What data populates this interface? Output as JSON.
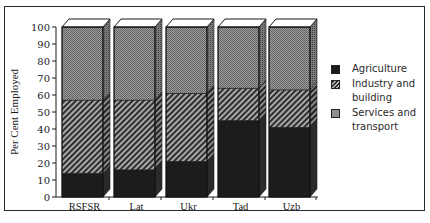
{
  "chart_data": {
    "type": "bar",
    "stacked": true,
    "style": "3d",
    "title": "",
    "xlabel": "",
    "ylabel": "Per Cent Employed",
    "ylim": [
      0,
      100
    ],
    "yticks": [
      0,
      10,
      20,
      30,
      40,
      50,
      60,
      70,
      80,
      90,
      100
    ],
    "categories": [
      "RSFSR",
      "Lat",
      "Ukr",
      "Tad",
      "Uzb"
    ],
    "series": [
      {
        "name": "Agriculture",
        "values": [
          14,
          16,
          21,
          45,
          41
        ],
        "pattern": "solid-dark"
      },
      {
        "name": "Industry and building",
        "values": [
          43,
          41,
          40,
          19,
          22
        ],
        "pattern": "diagonal-hatch"
      },
      {
        "name": "Services and transport",
        "values": [
          43,
          43,
          39,
          36,
          37
        ],
        "pattern": "stipple-grey"
      }
    ],
    "legend": {
      "position": "right",
      "entries": [
        "Agriculture",
        "Industry and building",
        "Services and transport"
      ]
    },
    "grid": false
  },
  "legend": {
    "items": [
      {
        "label": "Agriculture"
      },
      {
        "label": "Industry and building"
      },
      {
        "label": "Services and transport"
      }
    ]
  },
  "colors": {
    "agriculture": "#1c1c1c",
    "industry_bg": "#9a9a9a",
    "industry_line": "#2e2e2e",
    "services": "#8e8e8e",
    "top_face": "#ffffff",
    "frame": "#2a2a2a"
  }
}
